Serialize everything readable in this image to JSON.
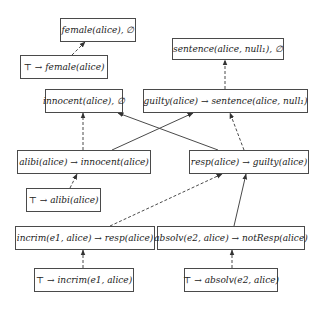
{
  "diagram": {
    "nodes": [
      {
        "id": "n_female_fact",
        "label": "female(alice), ∅",
        "x": 60,
        "y": 18,
        "w": 76,
        "h": 24
      },
      {
        "id": "n_top_female",
        "label": "⊤ → female(alice)",
        "x": 20,
        "y": 55,
        "w": 88,
        "h": 24
      },
      {
        "id": "n_sentence_fact",
        "label": "sentence(alice, null₁), ∅",
        "x": 172,
        "y": 38,
        "w": 112,
        "h": 22
      },
      {
        "id": "n_innocent_fact",
        "label": "innocent(alice), ∅",
        "x": 45,
        "y": 89,
        "w": 78,
        "h": 24
      },
      {
        "id": "n_guilty_rule",
        "label": "guilty(alice) → sentence(alice, null₁)",
        "x": 143,
        "y": 89,
        "w": 165,
        "h": 24
      },
      {
        "id": "n_alibi_rule",
        "label": "alibi(alice) → innocent(alice)",
        "x": 17,
        "y": 150,
        "w": 134,
        "h": 24
      },
      {
        "id": "n_resp_rule",
        "label": "resp(alice) → guilty(alice)",
        "x": 189,
        "y": 150,
        "w": 120,
        "h": 24
      },
      {
        "id": "n_top_alibi",
        "label": "⊤ → alibi(alice)",
        "x": 26,
        "y": 188,
        "w": 75,
        "h": 24
      },
      {
        "id": "n_incrim_rule",
        "label": "incrim(e1, alice) → resp(alice)",
        "x": 15,
        "y": 226,
        "w": 140,
        "h": 24
      },
      {
        "id": "n_absolv_rule",
        "label": "absolv(e2, alice) → notResp(alice)",
        "x": 157,
        "y": 226,
        "w": 148,
        "h": 24
      },
      {
        "id": "n_top_incrim",
        "label": "⊤ → incrim(e1, alice)",
        "x": 34,
        "y": 268,
        "w": 100,
        "h": 24
      },
      {
        "id": "n_top_absolv",
        "label": "⊤ → absolv(e2, alice)",
        "x": 184,
        "y": 268,
        "w": 94,
        "h": 24
      }
    ],
    "edges": [
      {
        "from": "n_top_female",
        "to": "n_female_fact",
        "style": "dashed",
        "x1": 72,
        "y1": 55,
        "x2": 85,
        "y2": 42
      },
      {
        "from": "n_guilty_rule",
        "to": "n_sentence_fact",
        "style": "dashed",
        "x1": 225,
        "y1": 89,
        "x2": 225,
        "y2": 60
      },
      {
        "from": "n_alibi_rule",
        "to": "n_innocent_fact",
        "style": "dashed",
        "x1": 83,
        "y1": 150,
        "x2": 83,
        "y2": 113
      },
      {
        "from": "n_alibi_rule",
        "to": "n_guilty_rule",
        "style": "solid",
        "x1": 112,
        "y1": 150,
        "x2": 193,
        "y2": 113
      },
      {
        "from": "n_resp_rule",
        "to": "n_innocent_fact",
        "style": "solid",
        "x1": 218,
        "y1": 150,
        "x2": 118,
        "y2": 113
      },
      {
        "from": "n_resp_rule",
        "to": "n_guilty_rule",
        "style": "dashed",
        "x1": 244,
        "y1": 150,
        "x2": 230,
        "y2": 113
      },
      {
        "from": "n_top_alibi",
        "to": "n_alibi_rule",
        "style": "dashed",
        "x1": 70,
        "y1": 188,
        "x2": 77,
        "y2": 174
      },
      {
        "from": "n_incrim_rule",
        "to": "n_resp_rule",
        "style": "dashed",
        "x1": 110,
        "y1": 226,
        "x2": 222,
        "y2": 174
      },
      {
        "from": "n_absolv_rule",
        "to": "n_resp_rule",
        "style": "solid",
        "x1": 234,
        "y1": 226,
        "x2": 246,
        "y2": 174
      },
      {
        "from": "n_top_incrim",
        "to": "n_incrim_rule",
        "style": "dashed",
        "x1": 83,
        "y1": 268,
        "x2": 83,
        "y2": 250
      },
      {
        "from": "n_top_absolv",
        "to": "n_absolv_rule",
        "style": "dashed",
        "x1": 232,
        "y1": 268,
        "x2": 232,
        "y2": 250
      }
    ],
    "colors": {
      "stroke": "#4a4a4a",
      "text": "#222222",
      "background": "#ffffff"
    }
  }
}
